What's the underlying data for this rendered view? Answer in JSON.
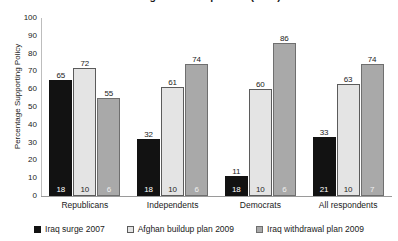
{
  "chart_data": {
    "type": "bar",
    "title": "and Afghan Buildup Plans (2008)",
    "xlabel": "",
    "ylabel": "Percentage Supporting Policy",
    "ylim": [
      0,
      100
    ],
    "yticks": [
      0,
      10,
      20,
      30,
      40,
      50,
      60,
      70,
      80,
      90,
      100
    ],
    "grid": false,
    "legend_position": "bottom",
    "categories": [
      "Republicans",
      "Independents",
      "Democrats",
      "All respondents"
    ],
    "series": [
      {
        "name": "Iraq surge 2007",
        "color": "#121212",
        "values": [
          65,
          32,
          11,
          33
        ],
        "base_labels": [
          18,
          18,
          18,
          21
        ]
      },
      {
        "name": "Afghan buildup plan 2009",
        "color": "#e4e4e4",
        "values": [
          72,
          61,
          60,
          63
        ],
        "base_labels": [
          10,
          10,
          10,
          10
        ]
      },
      {
        "name": "Iraq withdrawal plan 2009",
        "color": "#a9a9a9",
        "values": [
          55,
          74,
          86,
          74
        ],
        "base_labels": [
          6,
          6,
          6,
          7
        ]
      }
    ]
  }
}
